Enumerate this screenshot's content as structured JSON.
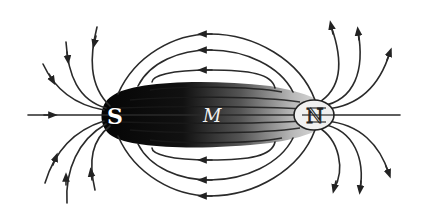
{
  "figure": {
    "labels": {
      "south_pole": "S",
      "magnet": "M",
      "north_pole": "N"
    },
    "colors": {
      "line": "#2a2a2a",
      "magnet_dark": "#0a0a0a",
      "magnet_light": "#e6e6e6",
      "background": "#ffffff"
    },
    "arrow_direction": {
      "outside_magnet": "from N to S (leftward on top and bottom loops)",
      "left_fan": "into S",
      "right_fan": "out of N"
    }
  }
}
